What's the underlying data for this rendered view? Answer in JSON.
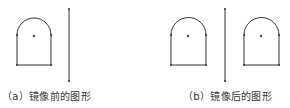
{
  "figures": [
    {
      "id": "a",
      "caption": "（a）镜像前的图形",
      "shapes": 1
    },
    {
      "id": "b",
      "caption": "（b）镜像后的图形",
      "shapes": 2
    }
  ],
  "colors": {
    "stroke": "#333333",
    "text": "#333333"
  }
}
